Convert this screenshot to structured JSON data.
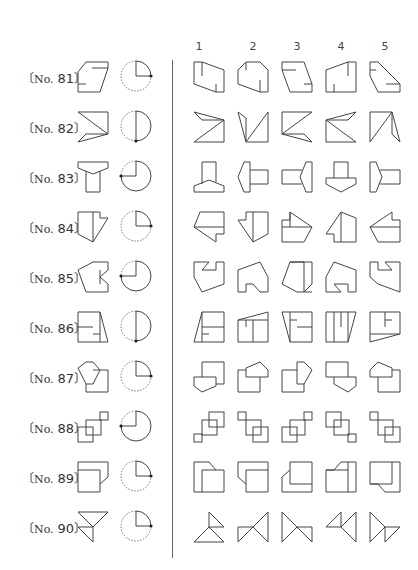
{
  "column_headers": [
    "1",
    "2",
    "3",
    "4",
    "5"
  ],
  "problems": [
    {
      "label": "No. 81",
      "rotation_deg": 90,
      "rotation_dir": "clockwise"
    },
    {
      "label": "No. 82",
      "rotation_deg": 180,
      "rotation_dir": "clockwise"
    },
    {
      "label": "No. 83",
      "rotation_deg": 270,
      "rotation_dir": "clockwise"
    },
    {
      "label": "No. 84",
      "rotation_deg": 90,
      "rotation_dir": "clockwise"
    },
    {
      "label": "No. 85",
      "rotation_deg": 270,
      "rotation_dir": "clockwise"
    },
    {
      "label": "No. 86",
      "rotation_deg": 180,
      "rotation_dir": "clockwise"
    },
    {
      "label": "No. 87",
      "rotation_deg": 90,
      "rotation_dir": "clockwise"
    },
    {
      "label": "No. 88",
      "rotation_deg": 270,
      "rotation_dir": "clockwise"
    },
    {
      "label": "No. 89",
      "rotation_deg": 90,
      "rotation_dir": "clockwise"
    },
    {
      "label": "No. 90",
      "rotation_deg": 90,
      "rotation_dir": "clockwise"
    }
  ],
  "label_parts": {
    "open": "〔",
    "close": "〕",
    "prefix": "No."
  },
  "numbers": [
    "81",
    "82",
    "83",
    "84",
    "85",
    "86",
    "87",
    "88",
    "89",
    "90"
  ],
  "colors": {
    "line": "#444444",
    "background": "#ffffff"
  }
}
